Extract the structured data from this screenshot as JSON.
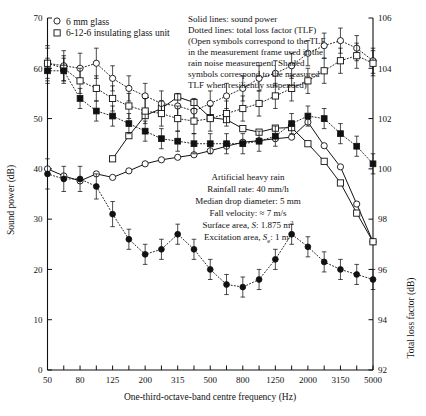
{
  "legend": {
    "items": [
      {
        "symbol": "open-circle",
        "label": "6 mm glass"
      },
      {
        "symbol": "open-square",
        "label": "6-12-6 insulating glass unit"
      }
    ]
  },
  "notes": {
    "lines": [
      "Solid lines: sound power",
      "Dotted lines: total loss factor (TLF)",
      "(Open symbols correspond to the TLF",
      "in the measurement frame used in the",
      "rain noise measurement. Shaded",
      "symbols correspond to the measured",
      "TLF when resiliently suspended)"
    ]
  },
  "conditions": {
    "lines": [
      "Artificial heavy rain",
      "Rainfall rate: 40 mm/h",
      "Median drop diameter: 5 mm",
      "Fall velocity: ≈ 7 m/s"
    ],
    "surface_area": {
      "prefix": "Surface area, ",
      "sym": "S",
      "value": ": 1.875 m",
      "sup": "2"
    },
    "excitation_area": {
      "prefix": "Excitation area, ",
      "sym": "S",
      "sub": "e",
      "value": ": 1 m",
      "sup": "2"
    }
  },
  "chart_data": {
    "type": "line",
    "title": "",
    "xlabel": "One-third-octave-band centre frequency (Hz)",
    "ylabel": "Sound power (dB)",
    "y2label": "Total loss factor (dB)",
    "xlim": [
      50,
      5000
    ],
    "ylim": [
      0,
      70
    ],
    "y2lim": [
      92,
      106
    ],
    "yticks": [
      0,
      10,
      20,
      30,
      40,
      50,
      60,
      70
    ],
    "y2ticks": [
      92,
      94,
      96,
      98,
      100,
      102,
      104,
      106
    ],
    "grid": false,
    "legend_position": "top-left",
    "categories": [
      50,
      63,
      80,
      100,
      125,
      160,
      200,
      250,
      315,
      400,
      500,
      630,
      800,
      1000,
      1250,
      1600,
      2000,
      2500,
      3150,
      4000,
      5000
    ],
    "xtick_labels": [
      "50",
      "80",
      "125",
      "200",
      "315",
      "500",
      "800",
      "1250",
      "2000",
      "3150",
      "5000"
    ],
    "series": [
      {
        "name": "6 mm glass sound power",
        "symbol": "open-circle",
        "line": "solid",
        "axis": "left",
        "values": [
          40.0,
          38.6,
          37.6,
          39.0,
          38.3,
          39.6,
          41.0,
          41.8,
          42.3,
          42.8,
          43.6,
          44.5,
          45.3,
          45.6,
          46.0,
          46.3,
          49.3,
          44.6,
          40.4,
          33.0,
          25.5
        ]
      },
      {
        "name": "6-12-6 insulating glass unit sound power",
        "symbol": "open-square",
        "line": "solid",
        "axis": "left",
        "values": [
          null,
          null,
          null,
          null,
          42.0,
          46.6,
          50.6,
          52.0,
          54.3,
          53.2,
          50.2,
          49.8,
          48.0,
          47.3,
          48.1,
          48.2,
          45.0,
          41.5,
          37.2,
          31.2,
          25.5
        ]
      },
      {
        "name": "6 mm glass TLF in measurement frame",
        "symbol": "open-circle",
        "line": "dotted",
        "axis": "right",
        "values": [
          104.2,
          104.1,
          104.0,
          104.2,
          103.6,
          103.2,
          102.9,
          102.6,
          102.5,
          102.3,
          102.6,
          102.9,
          103.2,
          103.6,
          103.8,
          104.1,
          104.6,
          104.9,
          105.1,
          104.8,
          104.3
        ],
        "errors": [
          0.7,
          0.6,
          0.6,
          0.6,
          0.5,
          0.5,
          0.5,
          0.5,
          0.5,
          0.5,
          0.5,
          0.5,
          0.5,
          0.5,
          0.5,
          0.5,
          0.5,
          0.5,
          0.5,
          0.5,
          0.5
        ]
      },
      {
        "name": "6-12-6 insulating glass unit TLF in measurement frame",
        "symbol": "open-square",
        "line": "dotted",
        "axis": "right",
        "values": [
          104.2,
          104.0,
          103.5,
          103.2,
          102.8,
          102.5,
          102.3,
          102.2,
          102.0,
          101.9,
          102.0,
          102.2,
          102.4,
          102.6,
          102.9,
          103.2,
          103.5,
          103.9,
          104.3,
          104.5,
          104.2
        ],
        "errors": [
          0.6,
          0.5,
          0.5,
          0.5,
          0.5,
          0.5,
          0.5,
          0.5,
          0.5,
          0.5,
          0.5,
          0.5,
          0.5,
          0.5,
          0.5,
          0.5,
          0.5,
          0.5,
          0.5,
          0.5,
          0.5
        ]
      },
      {
        "name": "6 mm glass TLF resiliently suspended",
        "symbol": "filled-square",
        "line": "dotted",
        "axis": "right",
        "values": [
          103.9,
          103.9,
          102.8,
          102.3,
          102.1,
          101.8,
          101.5,
          101.2,
          101.1,
          101.0,
          101.0,
          101.0,
          101.0,
          101.1,
          101.3,
          101.8,
          102.1,
          102.0,
          101.4,
          100.9,
          100.2
        ],
        "errors": [
          0.5,
          0.5,
          0.4,
          0.4,
          0.4,
          0.4,
          0.4,
          0.4,
          0.4,
          0.4,
          0.4,
          0.4,
          0.4,
          0.4,
          0.4,
          0.4,
          0.4,
          0.4,
          0.4,
          0.4,
          0.4
        ]
      },
      {
        "name": "6-12-6 insulating glass unit TLF resiliently suspended",
        "symbol": "filled-circle",
        "line": "dotted",
        "axis": "right",
        "values": [
          99.8,
          99.6,
          99.6,
          99.3,
          98.2,
          97.2,
          96.6,
          96.8,
          97.4,
          96.8,
          96.0,
          95.4,
          95.3,
          95.6,
          96.4,
          97.4,
          96.9,
          96.3,
          96.0,
          95.8,
          95.6
        ],
        "errors": [
          0.6,
          0.5,
          0.5,
          0.5,
          0.5,
          0.4,
          0.4,
          0.4,
          0.4,
          0.4,
          0.4,
          0.4,
          0.4,
          0.4,
          0.4,
          0.4,
          0.4,
          0.4,
          0.4,
          0.4,
          0.4
        ]
      }
    ]
  }
}
